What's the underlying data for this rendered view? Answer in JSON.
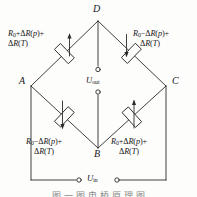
{
  "figure": {
    "type": "wheatstone-bridge-circuit",
    "nodes": [
      {
        "id": "D",
        "label": "D",
        "position": "top"
      },
      {
        "id": "A",
        "label": "A",
        "position": "left"
      },
      {
        "id": "C",
        "label": "C",
        "position": "right"
      },
      {
        "id": "B",
        "label": "B",
        "position": "bottom"
      }
    ],
    "resistors": [
      {
        "id": "R-AD",
        "branch": "A-D",
        "position": "top-left",
        "line1": "R0+ΔR(p)+",
        "line2": "ΔR(T)",
        "symbol": "strain-gauge-resistor"
      },
      {
        "id": "R-DC",
        "branch": "D-C",
        "position": "top-right",
        "line1": "R0−ΔR(p)+",
        "line2": "ΔR(T)",
        "symbol": "strain-gauge-resistor"
      },
      {
        "id": "R-AB",
        "branch": "A-B",
        "position": "bottom-left",
        "line1": "R0−ΔR(p)+",
        "line2": "ΔR(T)",
        "symbol": "strain-gauge-resistor"
      },
      {
        "id": "R-BC",
        "branch": "B-C",
        "position": "bottom-right",
        "line1": "R0+ΔR(p)+",
        "line2": "ΔR(T)",
        "symbol": "strain-gauge-resistor"
      }
    ],
    "ports": [
      {
        "id": "u-out",
        "label": "Uout",
        "base": "U",
        "sub": "out",
        "terminals": 2,
        "orientation": "vertical",
        "between": "D-B"
      },
      {
        "id": "u-in",
        "label": "Uin",
        "base": "U",
        "sub": "in",
        "terminals": 2,
        "orientation": "horizontal",
        "between": "A-C"
      }
    ],
    "colors": {
      "line": "#2b2b2b",
      "text": "#161616",
      "background": "#fdfdfc",
      "caption": "#8a8a88"
    },
    "caption_text": "图 一 图 电 桥 原 理 图"
  }
}
